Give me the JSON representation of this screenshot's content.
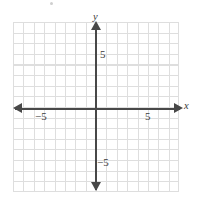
{
  "chart_data": {
    "type": "scatter",
    "title": "",
    "subtitle": "",
    "xlabel": "x",
    "ylabel": "y",
    "xlim": [
      -8,
      8
    ],
    "ylim": [
      -8,
      8
    ],
    "grid": true,
    "legend": null,
    "series": [],
    "x": [],
    "y": [],
    "annotations": [],
    "x_tick_labels": [
      "-5",
      "5"
    ],
    "y_tick_labels": [
      "5",
      "-5"
    ],
    "tick_step": 1,
    "labeled_tick_step": 5,
    "colors": {
      "axis": "#484848",
      "grid": "#dedede",
      "background": "#ffffff",
      "label": "#3a3a3a"
    }
  },
  "labels": {
    "y_axis_name": "y",
    "x_axis_name": "x",
    "y_positive_tick": "5",
    "y_negative_tick": "−5",
    "x_positive_tick": "5",
    "x_negative_tick": "−5"
  }
}
